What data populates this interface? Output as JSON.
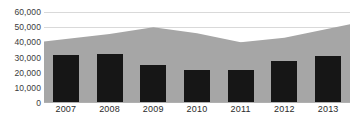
{
  "chart_data": {
    "type": "area",
    "title": "",
    "subtitle": "",
    "xlabel": "",
    "ylabel": "",
    "categories": [
      "2007",
      "2008",
      "2009",
      "2010",
      "2011",
      "2012",
      "2013"
    ],
    "ylim": [
      0,
      60000
    ],
    "ytick_labels": [
      "0",
      "10,000",
      "20,000",
      "30,000",
      "40,000",
      "50,000",
      "60,000"
    ],
    "ytick_values": [
      0,
      10000,
      20000,
      30000,
      40000,
      50000,
      60000
    ],
    "grid": true,
    "legend": "none",
    "series": [
      {
        "name": "area-series",
        "type": "area",
        "color": "#a6a6a6",
        "values": [
          40500,
          45500,
          50000,
          46000,
          40000,
          43000,
          52000
        ]
      },
      {
        "name": "bar-series",
        "type": "bar",
        "color": "#161616",
        "values": [
          31500,
          32000,
          25000,
          22000,
          22000,
          27500,
          31000
        ]
      }
    ]
  },
  "colors": {
    "area": "#a6a6a6",
    "bar": "#161616",
    "gridline": "#d9d9d9",
    "axis_text": "#3b3b3b",
    "background": "#ffffff"
  }
}
